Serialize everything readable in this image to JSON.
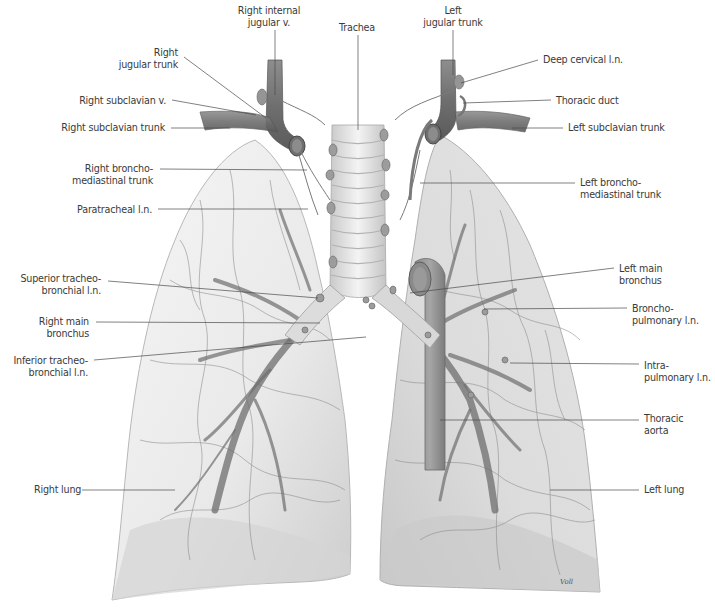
{
  "figure": {
    "artist_signature": "Voll",
    "colors": {
      "background": "#ffffff",
      "lung_fill": "#ececec",
      "lung_shadow": "#cfcfcf",
      "vessel": "#7a7a7a",
      "vessel_dark": "#5e5e5e",
      "trachea": "#e2e2e2",
      "label_text": "#3a3a3a",
      "leader_line": "#4a4a4a"
    }
  },
  "labels": {
    "right_internal_jugular_v": {
      "text": "Right internal\njugular v.",
      "x": 269,
      "y": 5,
      "align": "center",
      "line": [
        275,
        30,
        275,
        95
      ]
    },
    "trachea": {
      "text": "Trachea",
      "x": 357,
      "y": 22,
      "align": "center",
      "line": [
        358,
        35,
        358,
        130
      ]
    },
    "left_jugular_trunk": {
      "text": "Left\njugular trunk",
      "x": 453,
      "y": 5,
      "align": "center",
      "line": [
        453,
        30,
        453,
        75
      ]
    },
    "right_jugular_trunk": {
      "text": "Right\njugular trunk",
      "x": 178,
      "y": 47,
      "align": "right",
      "line": [
        184,
        57,
        266,
        118
      ]
    },
    "deep_cervical_ln": {
      "text": "Deep cervical l.n.",
      "x": 543,
      "y": 54,
      "align": "left",
      "line": [
        538,
        60,
        461,
        83
      ]
    },
    "right_subclavian_v": {
      "text": "Right subclavian v.",
      "x": 166,
      "y": 95,
      "align": "right",
      "line": [
        172,
        100,
        256,
        115
      ]
    },
    "thoracic_duct": {
      "text": "Thoracic duct",
      "x": 556,
      "y": 95,
      "align": "left",
      "line": [
        551,
        100,
        463,
        103
      ]
    },
    "right_subclavian_trunk": {
      "text": "Right subclavian trunk",
      "x": 165,
      "y": 122,
      "align": "right",
      "line": [
        171,
        128,
        230,
        128
      ]
    },
    "left_subclavian_trunk": {
      "text": "Left subclavian trunk",
      "x": 568,
      "y": 122,
      "align": "left",
      "line": [
        563,
        128,
        512,
        128
      ]
    },
    "right_bronchomediastinal_trunk": {
      "text": "Right broncho-\nmediastinal trunk",
      "x": 153,
      "y": 163,
      "align": "right",
      "line": [
        160,
        169,
        307,
        170
      ]
    },
    "left_bronchomediastinal_trunk": {
      "text": "Left broncho-\nmediastinal trunk",
      "x": 580,
      "y": 177,
      "align": "left",
      "line": [
        575,
        183,
        420,
        183
      ]
    },
    "paratracheal_ln": {
      "text": "Paratracheal l.n.",
      "x": 152,
      "y": 204,
      "align": "right",
      "line": [
        158,
        209,
        308,
        209
      ]
    },
    "superior_tracheobronchial_ln": {
      "text": "Superior tracheo-\nbronchial l.n.",
      "x": 101,
      "y": 273,
      "align": "right",
      "line": [
        108,
        281,
        318,
        298
      ]
    },
    "left_main_bronchus": {
      "text": "Left main\nbronchus",
      "x": 619,
      "y": 263,
      "align": "left",
      "line": [
        614,
        268,
        410,
        293
      ]
    },
    "right_main_bronchus": {
      "text": "Right main\nbronchus",
      "x": 89,
      "y": 316,
      "align": "right",
      "line": [
        96,
        322,
        320,
        323
      ]
    },
    "bronchopulmonary_ln": {
      "text": "Broncho-\npulmonary l.n.",
      "x": 632,
      "y": 303,
      "align": "left",
      "line": [
        627,
        308,
        484,
        309
      ]
    },
    "inferior_tracheobronchial_ln": {
      "text": "Inferior tracheo-\nbronchial l.n.",
      "x": 88,
      "y": 355,
      "align": "right",
      "line": [
        94,
        360,
        366,
        337
      ]
    },
    "intrapulmonary_ln": {
      "text": "Intra-\npulmonary l.n.",
      "x": 644,
      "y": 360,
      "align": "left",
      "line": [
        639,
        364,
        510,
        363
      ]
    },
    "thoracic_aorta": {
      "text": "Thoracic\naorta",
      "x": 644,
      "y": 413,
      "align": "left",
      "line": [
        639,
        420,
        440,
        420
      ]
    },
    "right_lung": {
      "text": "Right lung",
      "x": 34,
      "y": 484,
      "align": "left",
      "line": [
        82,
        490,
        175,
        490
      ]
    },
    "left_lung": {
      "text": "Left lung",
      "x": 644,
      "y": 484,
      "align": "left",
      "line": [
        639,
        490,
        550,
        490
      ]
    }
  }
}
